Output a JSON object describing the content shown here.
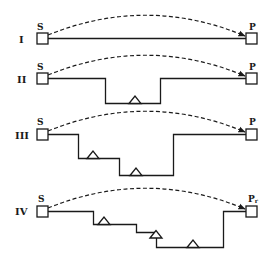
{
  "diagram": {
    "rows": [
      {
        "id": "I",
        "label": "I",
        "source": "S",
        "target": "P",
        "target_sub": "",
        "intermediates": 0
      },
      {
        "id": "II",
        "label": "II",
        "source": "S",
        "target": "P",
        "target_sub": "",
        "intermediates": 1
      },
      {
        "id": "III",
        "label": "III",
        "source": "S",
        "target": "P",
        "target_sub": "",
        "intermediates": 2
      },
      {
        "id": "IV",
        "label": "IV",
        "source": "S",
        "target": "P",
        "target_sub": "r",
        "intermediates": 3
      }
    ],
    "legend": {
      "square": "state node (S / P)",
      "triangle": "intermediate step",
      "dashed_arc": "direct transfer",
      "solid_line": "stepwise path"
    },
    "colors": {
      "ink": "#1a1a1a",
      "background": "#ffffff"
    }
  }
}
